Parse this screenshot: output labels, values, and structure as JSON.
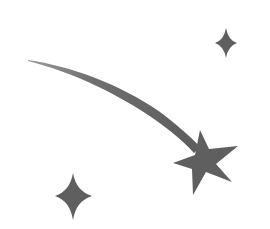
{
  "image": {
    "subject": "shooting star illustration",
    "background_color": "#ffffff",
    "fill_color": "#5f5f5f",
    "elements": [
      {
        "name": "shooting-star",
        "type": "five-point-star-with-trail"
      },
      {
        "name": "sparkle-top-right",
        "type": "four-point-sparkle"
      },
      {
        "name": "sparkle-bottom-left",
        "type": "four-point-sparkle"
      }
    ]
  }
}
